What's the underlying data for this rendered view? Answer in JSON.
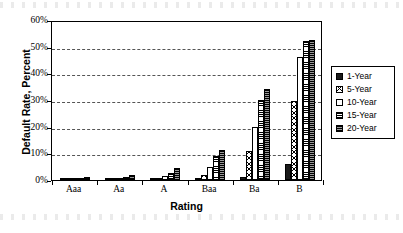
{
  "chart_data": {
    "type": "bar",
    "title": "",
    "xlabel": "Rating",
    "ylabel": "Default Rate, Percent",
    "categories": [
      "Aaa",
      "Aa",
      "A",
      "Baa",
      "Ba",
      "B"
    ],
    "ylim": [
      0,
      60
    ],
    "ytick_labels": [
      "0%",
      "10%",
      "20%",
      "30%",
      "40%",
      "50%",
      "60%"
    ],
    "ytick_values": [
      0,
      10,
      20,
      30,
      40,
      50,
      60
    ],
    "grid": true,
    "grid_axis": "y",
    "grid_style": "dashed",
    "legend_position": "right",
    "series": [
      {
        "name": "1-Year",
        "pattern": "solid-black",
        "color": "#1a1a1a",
        "values": [
          0.0,
          0.05,
          0.05,
          0.2,
          1.3,
          6.0
        ]
      },
      {
        "name": "5-Year",
        "pattern": "diamond-hatch",
        "color": "#ffffff",
        "values": [
          0.1,
          0.3,
          0.5,
          1.8,
          11.0,
          29.5
        ]
      },
      {
        "name": "10-Year",
        "pattern": "empty-white",
        "color": "#ffffff",
        "values": [
          0.5,
          0.8,
          1.5,
          5.0,
          20.0,
          46.0
        ]
      },
      {
        "name": "15-Year",
        "pattern": "horizontal-lines",
        "color": "#ffffff",
        "values": [
          0.9,
          1.2,
          2.5,
          9.0,
          30.0,
          52.0
        ]
      },
      {
        "name": "20-Year",
        "pattern": "dark-fine-lines",
        "color": "#6e6e6e",
        "values": [
          1.0,
          2.0,
          4.4,
          11.2,
          34.0,
          52.5
        ]
      }
    ]
  },
  "legend": {
    "items": [
      {
        "label": "1-Year"
      },
      {
        "label": "5-Year"
      },
      {
        "label": "10-Year"
      },
      {
        "label": "15-Year"
      },
      {
        "label": "20-Year"
      }
    ]
  }
}
